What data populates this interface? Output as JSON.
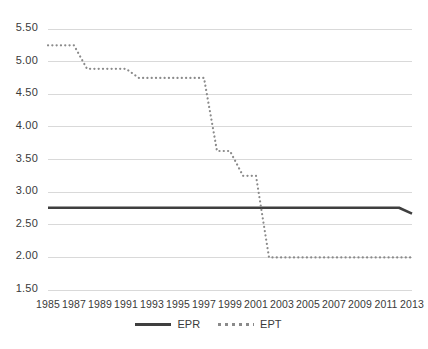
{
  "chart_data": {
    "type": "line",
    "title": "",
    "xlabel": "",
    "ylabel": "",
    "x": [
      1985,
      1986,
      1987,
      1988,
      1989,
      1990,
      1991,
      1992,
      1993,
      1994,
      1995,
      1996,
      1997,
      1998,
      1999,
      2000,
      2001,
      2002,
      2003,
      2004,
      2005,
      2006,
      2007,
      2008,
      2009,
      2010,
      2011,
      2012,
      2013
    ],
    "xlim": [
      1985,
      2013
    ],
    "ylim": [
      1.5,
      5.5
    ],
    "yticks": [
      "1.50",
      "2.00",
      "2.50",
      "3.00",
      "3.50",
      "4.00",
      "4.50",
      "5.00",
      "5.50"
    ],
    "ytick_values": [
      1.5,
      2.0,
      2.5,
      3.0,
      3.5,
      4.0,
      4.5,
      5.0,
      5.5
    ],
    "xticks": [
      "1985",
      "1987",
      "1989",
      "1991",
      "1993",
      "1995",
      "1997",
      "1999",
      "2001",
      "2003",
      "2005",
      "2007",
      "2009",
      "2011",
      "2013"
    ],
    "xtick_values": [
      1985,
      1987,
      1989,
      1991,
      1993,
      1995,
      1997,
      1999,
      2001,
      2003,
      2005,
      2007,
      2009,
      2011,
      2013
    ],
    "grid": "horizontal",
    "legend_position": "bottom",
    "series": [
      {
        "name": "EPR",
        "style": "solid",
        "color": "#3f3f3f",
        "values": [
          2.76,
          2.76,
          2.76,
          2.76,
          2.76,
          2.76,
          2.76,
          2.76,
          2.76,
          2.76,
          2.76,
          2.76,
          2.76,
          2.76,
          2.76,
          2.76,
          2.76,
          2.76,
          2.76,
          2.76,
          2.76,
          2.76,
          2.76,
          2.76,
          2.76,
          2.76,
          2.76,
          2.76,
          2.67
        ]
      },
      {
        "name": "EPT",
        "style": "dotted",
        "color": "#8a8a8a",
        "values": [
          5.25,
          5.25,
          5.25,
          4.89,
          4.89,
          4.89,
          4.89,
          4.75,
          4.75,
          4.75,
          4.75,
          4.75,
          4.75,
          3.63,
          3.63,
          3.25,
          3.25,
          2.0,
          2.0,
          2.0,
          2.0,
          2.0,
          2.0,
          2.0,
          2.0,
          2.0,
          2.0,
          2.0,
          2.0
        ]
      }
    ]
  },
  "legend": {
    "items": [
      {
        "label": "EPR",
        "style": "solid"
      },
      {
        "label": "EPT",
        "style": "dotted"
      }
    ]
  }
}
